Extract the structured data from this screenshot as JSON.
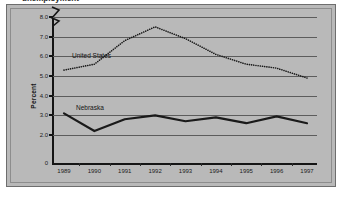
{
  "title": "unemployment",
  "axis": {
    "ylabel": "Percent",
    "ytick_labels": [
      "8.0",
      "7.0",
      "6.0",
      "5.0",
      "4.0",
      "3.0",
      "2.0",
      "0"
    ],
    "xtick_labels": [
      "1989",
      "1990",
      "1991",
      "1992",
      "1993",
      "1994",
      "1995",
      "1996",
      "1997"
    ],
    "break_symbol": "axis-break-zigzag"
  },
  "annotations": {
    "united_states": "United States",
    "nebraska": "Nebraska"
  },
  "colors": {
    "panel": "#b9b9b9",
    "frame": "#6e6e6e",
    "grid": "#5c5c5c",
    "axis": "#151515",
    "series": "#1a1a1a",
    "page": "#ffffff"
  },
  "chart_data": {
    "type": "line",
    "title": "unemployment",
    "xlabel": "",
    "ylabel": "Percent",
    "categories": [
      "1989",
      "1990",
      "1991",
      "1992",
      "1993",
      "1994",
      "1995",
      "1996",
      "1997"
    ],
    "ylim": [
      2.0,
      8.0
    ],
    "yticks": [
      2.0,
      3.0,
      4.0,
      5.0,
      6.0,
      7.0,
      8.0
    ],
    "y_axis_break_below": 2.0,
    "grid": true,
    "legend": "inline-annotations",
    "series": [
      {
        "name": "United States",
        "style": "dotted",
        "values": [
          5.3,
          5.6,
          6.8,
          7.5,
          6.9,
          6.1,
          5.6,
          5.4,
          4.9
        ]
      },
      {
        "name": "Nebraska",
        "style": "solid-thick",
        "values": [
          3.1,
          2.2,
          2.8,
          3.0,
          2.7,
          2.9,
          2.6,
          2.95,
          2.6
        ]
      }
    ]
  }
}
